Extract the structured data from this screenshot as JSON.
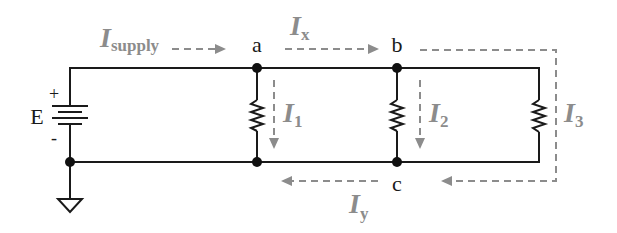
{
  "diagram": {
    "type": "parallel-resistor-circuit",
    "source": {
      "label": "E",
      "plus": "+",
      "minus": "-"
    },
    "nodes": [
      {
        "id": "a",
        "label": "a"
      },
      {
        "id": "b",
        "label": "b"
      },
      {
        "id": "c",
        "label": "c"
      }
    ],
    "currents": {
      "supply": {
        "main": "I",
        "sub": "supply"
      },
      "x": {
        "main": "I",
        "sub": "x"
      },
      "y": {
        "main": "I",
        "sub": "y"
      },
      "i1": {
        "main": "I",
        "sub": "1"
      },
      "i2": {
        "main": "I",
        "sub": "2"
      },
      "i3": {
        "main": "I",
        "sub": "3"
      }
    },
    "colors": {
      "wire": "#1a1a1a",
      "current_arrow": "#8c8c8c",
      "background": "#ffffff"
    }
  }
}
